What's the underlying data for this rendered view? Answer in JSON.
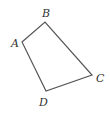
{
  "diagram": {
    "type": "quadrilateral",
    "vertices": [
      {
        "name": "A",
        "x": 22,
        "y": 42,
        "label_x": 11,
        "label_y": 47
      },
      {
        "name": "B",
        "x": 45,
        "y": 22,
        "label_x": 42,
        "label_y": 17
      },
      {
        "name": "C",
        "x": 92,
        "y": 75,
        "label_x": 96,
        "label_y": 82
      },
      {
        "name": "D",
        "x": 46,
        "y": 91,
        "label_x": 39,
        "label_y": 106
      }
    ],
    "edges": [
      [
        "A",
        "B"
      ],
      [
        "B",
        "C"
      ],
      [
        "C",
        "D"
      ],
      [
        "D",
        "A"
      ]
    ],
    "stroke_color": "#555555",
    "label_color": "#333333"
  }
}
